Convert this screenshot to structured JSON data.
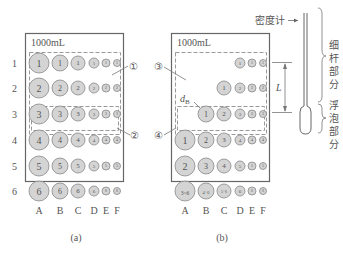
{
  "figure_a": {
    "volume_label": "1000mL",
    "row_labels": [
      "1",
      "2",
      "3",
      "4",
      "5",
      "6"
    ],
    "col_labels": [
      "A",
      "B",
      "C",
      "D",
      "E",
      "F"
    ],
    "rows": [
      [
        "1",
        "1",
        "1",
        "1",
        "1",
        "1"
      ],
      [
        "2",
        "2",
        "2",
        "2",
        "2",
        "2"
      ],
      [
        "3",
        "3",
        "3",
        "3",
        "3",
        "3"
      ],
      [
        "4",
        "4",
        "4",
        "4",
        "4",
        "4"
      ],
      [
        "5",
        "5",
        "5",
        "5",
        "5",
        "5"
      ],
      [
        "6",
        "6",
        "6",
        "6",
        "6",
        "6"
      ]
    ],
    "callout_1": "①",
    "callout_2": "②",
    "caption": "(a)"
  },
  "figure_b": {
    "volume_label": "1000mL",
    "col_labels": [
      "A",
      "B",
      "C",
      "D",
      "E",
      "F"
    ],
    "rows": [
      [
        "",
        "",
        "",
        "1",
        "1",
        "1"
      ],
      [
        "",
        "",
        "1",
        "2",
        "2",
        "2"
      ],
      [
        "",
        "1",
        "2",
        "3",
        "3",
        "3"
      ],
      [
        "1",
        "2",
        "3",
        "4",
        "4",
        "4"
      ],
      [
        "2",
        "3",
        "4",
        "5",
        "5",
        "5"
      ],
      [
        "3~6",
        "4~6",
        "5~6",
        "6",
        "6",
        "6"
      ]
    ],
    "d_label": "d",
    "d_subscript": "B",
    "callout_3": "③",
    "callout_4": "④",
    "length_label": "L",
    "caption": "(b)"
  },
  "hydrometer": {
    "label": "密度计",
    "stem_label": [
      "细",
      "杆",
      "部",
      "分"
    ],
    "bulb_label": [
      "浮",
      "泡",
      "部",
      "分"
    ]
  }
}
